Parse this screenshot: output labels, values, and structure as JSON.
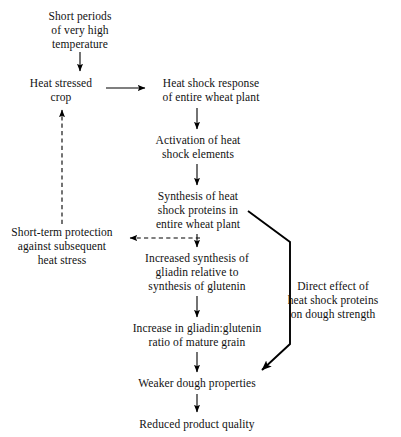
{
  "diagram": {
    "background_color": "#ffffff",
    "ink_color": "#000000",
    "nodes": {
      "short_periods": {
        "lines": [
          "Short periods",
          "of very high",
          "temperature"
        ]
      },
      "heat_stressed_crop": {
        "lines": [
          "Heat stressed",
          "crop"
        ]
      },
      "heat_shock_response": {
        "lines": [
          "Heat shock response",
          "of entire wheat plant"
        ]
      },
      "activation": {
        "lines": [
          "Activation of heat",
          "shock elements"
        ]
      },
      "synthesis_hsp": {
        "lines": [
          "Synthesis of heat",
          "shock proteins in",
          "entire wheat plant"
        ]
      },
      "short_term_protection": {
        "lines": [
          "Short-term protection",
          "against subsequent",
          "heat stress"
        ]
      },
      "increased_synthesis": {
        "lines": [
          "Increased synthesis of",
          "gliadin relative to",
          "synthesis of glutenin"
        ]
      },
      "increase_ratio": {
        "lines": [
          "Increase in gliadin:glutenin",
          "ratio of mature grain"
        ]
      },
      "weaker_dough": {
        "lines": [
          "Weaker dough properties"
        ]
      },
      "reduced_quality": {
        "lines": [
          "Reduced product quality"
        ]
      },
      "direct_effect": {
        "lines": [
          "Direct effect of",
          "heat shock proteins",
          "on dough strength"
        ]
      }
    },
    "edges": [
      {
        "name": "short-periods-to-heat-stressed-crop",
        "style": "solid",
        "direction": "down"
      },
      {
        "name": "heat-stressed-crop-to-heat-shock-response",
        "style": "solid",
        "direction": "right"
      },
      {
        "name": "heat-shock-response-to-activation",
        "style": "solid",
        "direction": "down"
      },
      {
        "name": "activation-to-synthesis-hsp",
        "style": "solid",
        "direction": "down"
      },
      {
        "name": "synthesis-hsp-to-increased-synthesis",
        "style": "solid",
        "direction": "down"
      },
      {
        "name": "synthesis-hsp-to-short-term-protection",
        "style": "dashed",
        "direction": "left"
      },
      {
        "name": "short-term-protection-to-heat-stressed-crop",
        "style": "dashed",
        "direction": "up"
      },
      {
        "name": "increased-synthesis-to-increase-ratio",
        "style": "solid",
        "direction": "down"
      },
      {
        "name": "increase-ratio-to-weaker-dough",
        "style": "solid",
        "direction": "down"
      },
      {
        "name": "weaker-dough-to-reduced-quality",
        "style": "solid",
        "direction": "down"
      },
      {
        "name": "synthesis-hsp-to-weaker-dough-direct",
        "style": "solid-thick",
        "direction": "down-left"
      }
    ]
  }
}
